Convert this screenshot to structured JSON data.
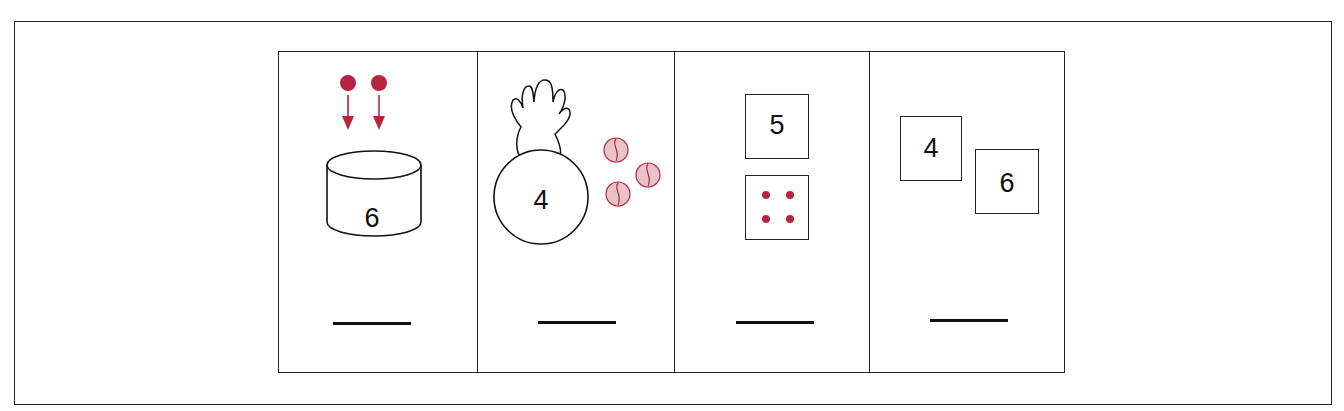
{
  "colors": {
    "accent_red": "#B5253F",
    "marble_fill": "#E8C4CA",
    "line": "#222222"
  },
  "exercises": [
    {
      "id": 1,
      "type": "cylinder-plus-dots",
      "container_number": "6",
      "dots_added": 2,
      "answer_blank": ""
    },
    {
      "id": 2,
      "type": "bag-plus-marbles",
      "container_number": "4",
      "marbles": 3,
      "answer_blank": ""
    },
    {
      "id": 3,
      "type": "number-card-plus-dot-card",
      "card_number": "5",
      "dot_card_dots": 4,
      "answer_blank": ""
    },
    {
      "id": 4,
      "type": "two-number-cards",
      "card_a": "4",
      "card_b": "6",
      "answer_blank": ""
    }
  ]
}
